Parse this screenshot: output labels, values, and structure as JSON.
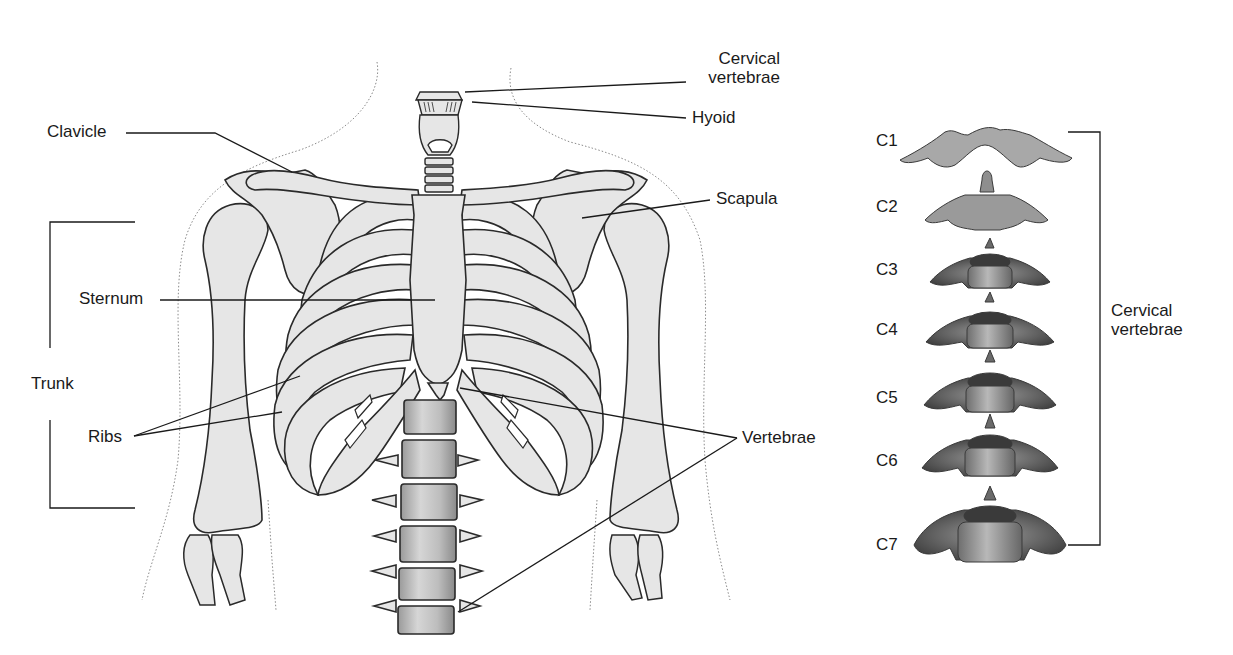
{
  "diagram": {
    "colors": {
      "bone_fill": "#e6e6e6",
      "bone_stroke": "#2a2a2a",
      "leader_line": "#1a1a1a",
      "skin_outline": "#8a8a8a",
      "vertebra_dark": "#4a4a4a",
      "vertebra_mid": "#8c8c8c",
      "vertebra_light": "#c8c8c8",
      "background": "#ffffff"
    },
    "labels": {
      "cervical_vertebrae_top": [
        "Cervical",
        "vertebrae"
      ],
      "hyoid": "Hyoid",
      "clavicle": "Clavicle",
      "scapula": "Scapula",
      "sternum": "Sternum",
      "trunk": "Trunk",
      "ribs": "Ribs",
      "vertebrae": "Vertebrae",
      "cervical_vertebrae_side": [
        "Cervical",
        "vertebrae"
      ]
    },
    "cervical_series": [
      {
        "id": "C1",
        "label": "C1"
      },
      {
        "id": "C2",
        "label": "C2"
      },
      {
        "id": "C3",
        "label": "C3"
      },
      {
        "id": "C4",
        "label": "C4"
      },
      {
        "id": "C5",
        "label": "C5"
      },
      {
        "id": "C6",
        "label": "C6"
      },
      {
        "id": "C7",
        "label": "C7"
      }
    ]
  }
}
